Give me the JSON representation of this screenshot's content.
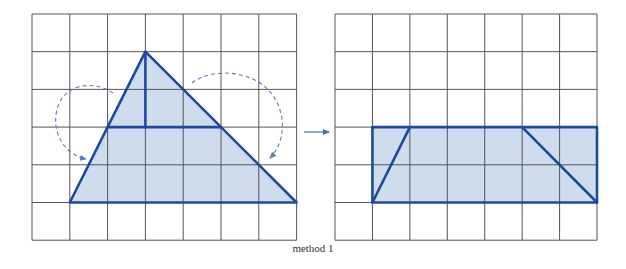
{
  "caption": "method 1",
  "colors": {
    "grid": "#555555",
    "shape_stroke": "#1d4a9e",
    "shape_fill": "#cfdcee",
    "dashed_arrow": "#5b7db8",
    "transform_arrow": "#4a6fb0"
  },
  "left_grid": {
    "x": 32,
    "y": 14,
    "cols": 7,
    "rows": 6,
    "cell_w": 37.8,
    "cell_h": 37.7,
    "shape": {
      "type": "triangle",
      "vertices": [
        [
          3,
          1
        ],
        [
          1,
          5
        ],
        [
          7,
          5
        ]
      ],
      "cut_lines": [
        {
          "from": [
            2,
            3
          ],
          "to": [
            5,
            3
          ]
        },
        {
          "from": [
            3,
            1
          ],
          "to": [
            3,
            3
          ]
        }
      ]
    },
    "rotation_arrows": [
      {
        "name": "left-rotation-arrow",
        "path": "M113,93 C95,80 60,82 56,115 C53,140 70,156 86,159"
      },
      {
        "name": "right-rotation-arrow",
        "path": "M192,83 C215,65 268,70 280,110 C286,130 280,148 270,158"
      }
    ]
  },
  "transform_arrow": {
    "x1": 304,
    "y1": 132,
    "x2": 329,
    "y2": 132
  },
  "right_grid": {
    "x": 335,
    "y": 14,
    "cols": 7,
    "rows": 6,
    "cell_w": 37.43,
    "cell_h": 37.7,
    "shape": {
      "type": "rectangle",
      "vertices": [
        [
          1,
          3
        ],
        [
          7,
          3
        ],
        [
          7,
          5
        ],
        [
          1,
          5
        ]
      ],
      "cut_lines": [
        {
          "from": [
            1,
            5
          ],
          "to": [
            2,
            3
          ]
        },
        {
          "from": [
            5,
            3
          ],
          "to": [
            7,
            5
          ]
        }
      ]
    }
  }
}
